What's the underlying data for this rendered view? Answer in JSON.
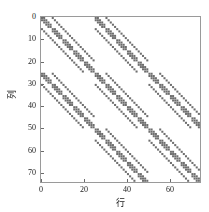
{
  "figure": {
    "type": "spy-plot",
    "background_color": "#ffffff",
    "marker_color": "#6e6e6e",
    "axis_color": "#9a9a9a",
    "text_color": "#1a1a1a"
  },
  "chart_data": {
    "type": "scatter",
    "title": "",
    "xlabel": "行",
    "ylabel": "列",
    "xlim": [
      0,
      74
    ],
    "ylim": [
      74,
      0
    ],
    "y_inverted": true,
    "grid": false,
    "legend": null,
    "xticks": [
      0,
      20,
      40,
      60
    ],
    "xtick_labels": [
      "0",
      "20",
      "40",
      "60"
    ],
    "yticks": [
      0,
      10,
      20,
      30,
      40,
      50,
      60,
      70
    ],
    "ytick_labels": [
      "0",
      "10",
      "20",
      "30",
      "40",
      "50",
      "60",
      "70"
    ],
    "marker": "square",
    "marker_size": 2,
    "marker_color": "#6e6e6e",
    "matrix": {
      "rows": 75,
      "cols": 75,
      "structure": "block-tridiagonal",
      "block_size": 25,
      "block_grid": 3,
      "active_blocks": [
        [
          0,
          0
        ],
        [
          0,
          1
        ],
        [
          1,
          0
        ],
        [
          1,
          1
        ],
        [
          1,
          2
        ],
        [
          2,
          1
        ],
        [
          2,
          2
        ]
      ],
      "sub_block_size": 5,
      "sub_structure": "block-tridiagonal",
      "diagonal_offsets": [
        -5,
        -1,
        0,
        1,
        5
      ],
      "description": "Sparse finite-difference stencil matrix: 75x75 block-tridiagonal with 25x25 blocks, each block itself block-tridiagonal with 5x5 sub-blocks."
    }
  }
}
